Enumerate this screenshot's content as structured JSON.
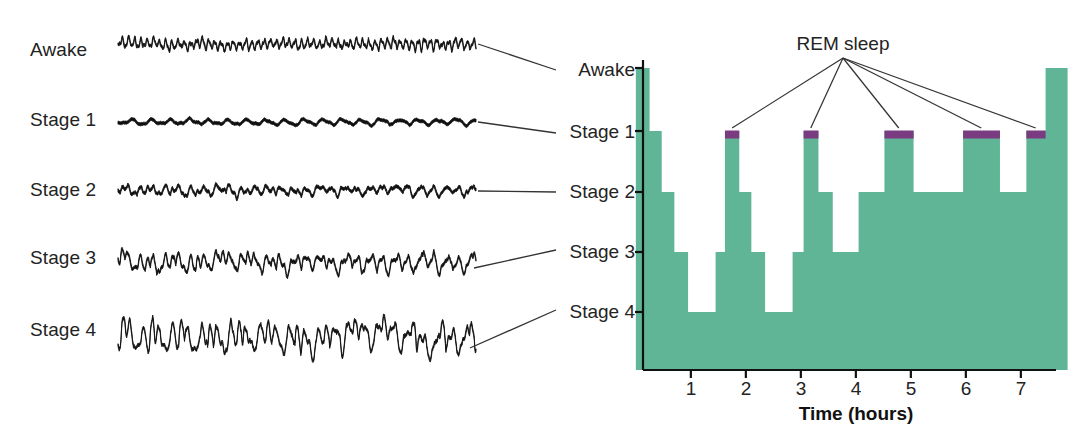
{
  "figure": {
    "left_panel_title": "",
    "right_panel_title": ""
  },
  "eeg": {
    "traces": [
      {
        "label": "Awake",
        "name": "awake"
      },
      {
        "label": "Stage 1",
        "name": "stage-1"
      },
      {
        "label": "Stage 2",
        "name": "stage-2"
      },
      {
        "label": "Stage 3",
        "name": "stage-3"
      },
      {
        "label": "Stage 4",
        "name": "stage-4"
      }
    ]
  },
  "hypnogram": {
    "rem_label": "REM sleep",
    "y_labels": [
      "Awake",
      "Stage 1",
      "Stage 2",
      "Stage 3",
      "Stage 4"
    ],
    "x_labels": [
      "1",
      "2",
      "3",
      "4",
      "5",
      "6",
      "7"
    ],
    "x_axis_title": "Time (hours)"
  },
  "colors": {
    "sleep_fill": "#5fb596",
    "rem_fill": "#7a3b80",
    "axis": "#111111",
    "text": "#232323",
    "leader_line": "#333333"
  },
  "chart_data": {
    "type": "area",
    "xlabel": "Time (hours)",
    "ylabel": "",
    "xlim": [
      0,
      7.9
    ],
    "ylim": [
      0,
      5
    ],
    "grid": false,
    "legend": "none",
    "y_categories": [
      "Awake",
      "Stage 1",
      "Stage 2",
      "Stage 3",
      "Stage 4"
    ],
    "y_tick_values": [
      0,
      1,
      2,
      3,
      4
    ],
    "x_ticks": [
      1,
      2,
      3,
      4,
      5,
      6,
      7
    ],
    "note": "Step series: each segment is [start_hour, end_hour, stage]; stage 0=Awake, 1=Stage 1, 2=Stage 2, 3=Stage 3, 4=Stage 4",
    "series": [
      {
        "name": "Sleep stage",
        "segments": [
          [
            0.0,
            0.25,
            0
          ],
          [
            0.25,
            0.47,
            1
          ],
          [
            0.47,
            0.7,
            2
          ],
          [
            0.7,
            0.95,
            3
          ],
          [
            0.95,
            1.45,
            4
          ],
          [
            1.45,
            1.62,
            3
          ],
          [
            1.62,
            1.88,
            1
          ],
          [
            1.88,
            2.1,
            2
          ],
          [
            2.1,
            2.35,
            3
          ],
          [
            2.35,
            2.85,
            4
          ],
          [
            2.85,
            3.05,
            3
          ],
          [
            3.05,
            3.32,
            1
          ],
          [
            3.32,
            3.58,
            2
          ],
          [
            3.58,
            4.05,
            3
          ],
          [
            4.05,
            4.52,
            2
          ],
          [
            4.52,
            5.05,
            1
          ],
          [
            5.05,
            5.95,
            2
          ],
          [
            5.95,
            6.62,
            1
          ],
          [
            6.62,
            7.1,
            2
          ],
          [
            7.1,
            7.45,
            1
          ],
          [
            7.45,
            7.85,
            0
          ]
        ]
      }
    ],
    "rem_episodes": [
      {
        "start": 1.62,
        "end": 1.88,
        "stage": 1
      },
      {
        "start": 3.05,
        "end": 3.32,
        "stage": 1
      },
      {
        "start": 4.52,
        "end": 5.05,
        "stage": 1
      },
      {
        "start": 5.95,
        "end": 6.62,
        "stage": 1
      },
      {
        "start": 7.1,
        "end": 7.45,
        "stage": 1
      }
    ],
    "annotations": [
      {
        "text": "REM sleep",
        "x": 3.6,
        "y_px": 43,
        "points_to": [
          1.75,
          3.18,
          4.78,
          6.28,
          7.27
        ]
      }
    ]
  }
}
